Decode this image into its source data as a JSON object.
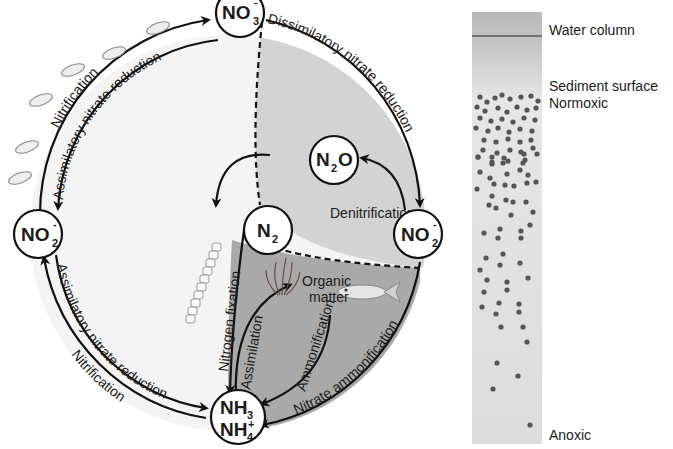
{
  "diagram": {
    "nodes": {
      "no3_top": {
        "main": "NO",
        "sub": "3",
        "sup": "-"
      },
      "no2_left": {
        "main": "NO",
        "sub": "2",
        "sup": "-"
      },
      "no2_right": {
        "main": "NO",
        "sub": "2",
        "sup": "-"
      },
      "n2o": {
        "main": "N",
        "sub": "2",
        "tail": "O"
      },
      "n2": {
        "main": "N",
        "sub": "2"
      },
      "nh3": {
        "main": "NH",
        "sub": "3"
      },
      "nh4": {
        "main": "NH",
        "sub": "4",
        "sup": "+"
      }
    },
    "processes": {
      "nitrification_upper": "Nitrification",
      "assimilatory_upper": "Assimilatory nitrate reduction",
      "dissimilatory": "Dissimilatory nitrate reduction",
      "denitrification": "Denitrification",
      "assimilatory_lower": "Assimilatory nitrate reduction",
      "nitrification_lower": "Nitrification",
      "nitrogen_fixation": "Nitrogen fixation",
      "assimilation": "Assimilation",
      "ammonification": "Ammonification",
      "nitrate_ammonification": "Nitrate ammonification",
      "organic_matter_line1": "Organic",
      "organic_matter_line2": "matter"
    },
    "colors": {
      "outer_fill": "#f4f4f4",
      "denitrification_zone": "#d3d3d3",
      "anoxic_zone": "#a9a9a9",
      "stroke": "#111111",
      "dots": "#555555"
    }
  },
  "sediment_column": {
    "labels": {
      "water_column": "Water column",
      "sediment_surface": "Sediment surface",
      "normoxic": "Normoxic",
      "anoxic": "Anoxic"
    }
  }
}
